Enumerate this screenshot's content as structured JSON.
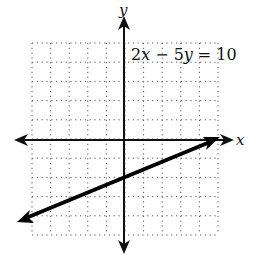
{
  "chart_data": {
    "type": "line",
    "title": "",
    "equation": "2x − 5y = 10",
    "equation_parts": {
      "a": "2",
      "x": "x",
      "minus": "−",
      "b": "5",
      "y": "y",
      "eq": "=",
      "c": "10"
    },
    "xlabel": "x",
    "ylabel": "y",
    "xlim": [
      -5,
      5
    ],
    "ylim": [
      -5,
      5
    ],
    "grid": true,
    "series": [
      {
        "name": "2x − 5y = 10",
        "slope": 0.4,
        "intercept": -2,
        "x": [
          -5.8,
          0,
          5
        ],
        "y": [
          -4.32,
          -2,
          0
        ]
      }
    ]
  },
  "colors": {
    "axis": "#111111",
    "grid": "#555555",
    "line": "#000000"
  }
}
